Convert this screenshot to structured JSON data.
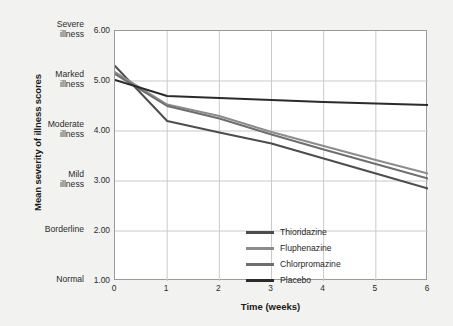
{
  "chart_data": {
    "type": "line",
    "title": "",
    "xlabel": "Time (weeks)",
    "ylabel": "Mean severity of illness scores",
    "x": [
      0,
      1,
      2,
      3,
      4,
      5,
      6
    ],
    "xlim": [
      0,
      6
    ],
    "ylim": [
      1.0,
      6.0
    ],
    "grid": true,
    "legend_position": "inside-lower-left",
    "x_tick_labels": [
      "0",
      "1",
      "2",
      "3",
      "4",
      "5",
      "6"
    ],
    "y_tick_labels": [
      "1.00",
      "2.00",
      "3.00",
      "4.00",
      "5.00",
      "6.00"
    ],
    "y_tick_values": [
      1.0,
      2.0,
      3.0,
      4.0,
      5.0,
      6.0
    ],
    "y_category_labels": [
      {
        "value": 6.0,
        "label": "Severe illness"
      },
      {
        "value": 5.0,
        "label": "Marked illness"
      },
      {
        "value": 4.0,
        "label": "Moderate illness"
      },
      {
        "value": 3.0,
        "label": "Mild illness"
      },
      {
        "value": 2.0,
        "label": "Borderline"
      },
      {
        "value": 1.0,
        "label": "Normal"
      }
    ],
    "series": [
      {
        "name": "Thioridazine",
        "color": "#4d4d4d",
        "values": [
          5.3,
          4.2,
          3.97,
          3.75,
          3.45,
          3.15,
          2.85
        ]
      },
      {
        "name": "Fluphenazine",
        "color": "#8c8c8c",
        "values": [
          5.18,
          4.53,
          4.3,
          3.98,
          3.7,
          3.42,
          3.15
        ]
      },
      {
        "name": "Chlorpromazine",
        "color": "#6e6e6e",
        "values": [
          5.14,
          4.5,
          4.25,
          3.93,
          3.63,
          3.34,
          3.05
        ]
      },
      {
        "name": "Placebo",
        "color": "#2b2b2b",
        "values": [
          5.02,
          4.7,
          4.66,
          4.62,
          4.58,
          4.55,
          4.52
        ]
      }
    ]
  },
  "colors": {
    "page_background": "#f2f2f0",
    "plot_background": "#ffffff",
    "plot_border": "#9a9a9a",
    "gridline": "#c9c9c9",
    "text": "#2b2b2b"
  }
}
